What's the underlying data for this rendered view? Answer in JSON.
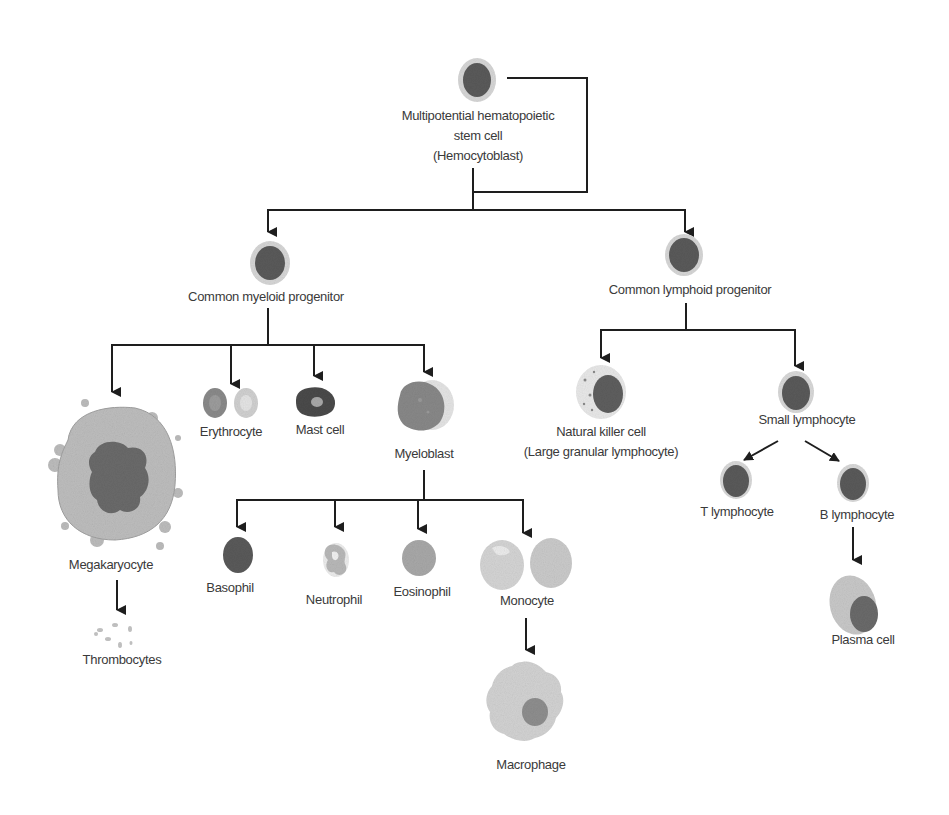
{
  "colors": {
    "line": "#1e1e1e",
    "text": "#3a3a3a",
    "nucleus": "#5e5e5e",
    "halo": "#d4d4d4",
    "cytoplasm": "#bdbdbd",
    "light_cell": "#d8d8d8"
  },
  "nodes": {
    "stem_cell": {
      "label_lines": [
        "Multipotential hematopoietic",
        "stem cell",
        "(Hemocytoblast)"
      ]
    },
    "myeloid_progenitor": {
      "label": "Common myeloid progenitor"
    },
    "lymphoid_progenitor": {
      "label": "Common lymphoid progenitor"
    },
    "megakaryocyte": {
      "label": "Megakaryocyte"
    },
    "thrombocytes": {
      "label": "Thrombocytes"
    },
    "erythrocyte": {
      "label": "Erythrocyte"
    },
    "mast_cell": {
      "label": "Mast cell"
    },
    "myeloblast": {
      "label": "Myeloblast"
    },
    "basophil": {
      "label": "Basophil"
    },
    "neutrophil": {
      "label": "Neutrophil"
    },
    "eosinophil": {
      "label": "Eosinophil"
    },
    "monocyte": {
      "label": "Monocyte"
    },
    "macrophage": {
      "label": "Macrophage"
    },
    "nk_cell": {
      "label_lines": [
        "Natural killer cell",
        "(Large granular lymphocyte)"
      ]
    },
    "small_lymphocyte": {
      "label": "Small lymphocyte"
    },
    "t_lymphocyte": {
      "label": "T lymphocyte"
    },
    "b_lymphocyte": {
      "label": "B lymphocyte"
    },
    "plasma_cell": {
      "label": "Plasma cell"
    }
  },
  "edges": [
    [
      "stem_cell",
      "myeloid_progenitor"
    ],
    [
      "stem_cell",
      "lymphoid_progenitor"
    ],
    [
      "myeloid_progenitor",
      "megakaryocyte"
    ],
    [
      "myeloid_progenitor",
      "erythrocyte"
    ],
    [
      "myeloid_progenitor",
      "mast_cell"
    ],
    [
      "myeloid_progenitor",
      "myeloblast"
    ],
    [
      "megakaryocyte",
      "thrombocytes"
    ],
    [
      "myeloblast",
      "basophil"
    ],
    [
      "myeloblast",
      "neutrophil"
    ],
    [
      "myeloblast",
      "eosinophil"
    ],
    [
      "myeloblast",
      "monocyte"
    ],
    [
      "monocyte",
      "macrophage"
    ],
    [
      "lymphoid_progenitor",
      "nk_cell"
    ],
    [
      "lymphoid_progenitor",
      "small_lymphocyte"
    ],
    [
      "small_lymphocyte",
      "t_lymphocyte"
    ],
    [
      "small_lymphocyte",
      "b_lymphocyte"
    ],
    [
      "b_lymphocyte",
      "plasma_cell"
    ]
  ]
}
